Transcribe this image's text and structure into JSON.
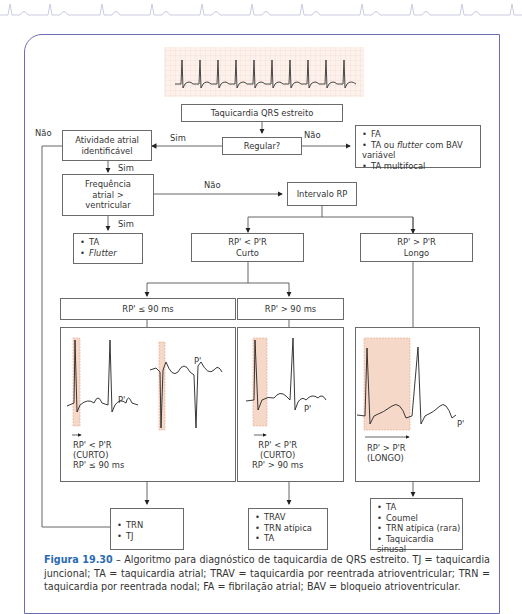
{
  "figure": {
    "number": "Figura 19.30",
    "caption": "Algoritmo para diagnóstico de taquicardia de QRS estreito. TJ = taquicardia juncional; TA = taquicardia atrial; TRAV = taquicardia por reentrada atrioventricular; TRN = taquicardia por reentrada nodal; FA = fibrilação atrial; BAV = bloqueio atrioventricular.",
    "separator": " – ",
    "accent_color": "#2a6bb3",
    "frame_color": "#6c6cb4"
  },
  "flowchart": {
    "start": "Taquicardia QRS estreito",
    "regular_q": "Regular?",
    "atrial_activity": [
      "Atividade atrial",
      "identificável"
    ],
    "freq_q": [
      "Frequência",
      "atrial >",
      "ventricular"
    ],
    "irregular_outcomes": [
      "FA",
      "TA ou flutter com BAV variável",
      "TA multifocal"
    ],
    "irregular_outcome_parts": {
      "pre": "TA ou ",
      "ital": "flutter",
      "post": " com BAV variável"
    },
    "freq_yes_outcomes": [
      "TA",
      "Flutter"
    ],
    "rp_interval": "Intervalo RP",
    "short_rp": [
      "RP' < P'R",
      "Curto"
    ],
    "long_rp": [
      "RP' > P'R",
      "Longo"
    ],
    "short_le90": "RP' ≤ 90 ms",
    "short_gt90": "RP' > 90 ms",
    "labels": {
      "nao_left": "Não",
      "sim_regular": "Sim",
      "nao_regular": "Não",
      "sim_atrial": "Sim",
      "nao_freq": "Não",
      "sim_freq": "Sim"
    },
    "panel_le90": {
      "p_label": "P'",
      "p_label2": "P'",
      "text": [
        "RP' < P'R",
        "(CURTO)",
        "RP' ≤ 90 ms"
      ]
    },
    "panel_gt90": {
      "p_label": "P'",
      "text": [
        "RP' < P'R",
        "(CURTO)",
        "RP' > 90 ms"
      ]
    },
    "panel_long": {
      "p_label": "P'",
      "text": [
        "RP' > P'R",
        "(LONGO)"
      ]
    },
    "outcome_le90": [
      "TRN",
      "TJ"
    ],
    "outcome_gt90": [
      "TRAV",
      "TRN atípica",
      "TA"
    ],
    "outcome_long": [
      "TA",
      "Coumel",
      "TRN atípica (rara)",
      "Taquicardia sinusal"
    ]
  }
}
